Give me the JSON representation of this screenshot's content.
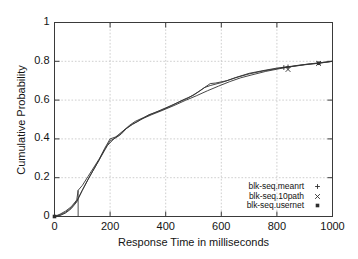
{
  "chart_data": {
    "type": "line",
    "title": "",
    "subtitle": "",
    "xlabel": "Response Time in milliseconds",
    "ylabel": "Cumulative Probability",
    "xlim": [
      0,
      1000
    ],
    "ylim": [
      0,
      1
    ],
    "xticks": [
      "0",
      "200",
      "400",
      "600",
      "800",
      "1000"
    ],
    "xtick_values": [
      0,
      200,
      400,
      600,
      800,
      1000
    ],
    "yticks": [
      "0",
      "0.2",
      "0.4",
      "0.6",
      "0.8",
      "1"
    ],
    "ytick_values": [
      0,
      0.2,
      0.4,
      0.6,
      0.8,
      1
    ],
    "grid": true,
    "legend_position": "bottom-right-inside",
    "annotations": [
      {
        "name": "vertical-drop-line",
        "x": 85,
        "y_from": 0,
        "y_to": 0.135
      }
    ],
    "series": [
      {
        "name": "blk-seq.meanrt",
        "marker": "plus",
        "x": [
          0,
          20,
          40,
          60,
          80,
          85,
          100,
          120,
          140,
          160,
          180,
          200,
          220,
          240,
          260,
          280,
          300,
          340,
          380,
          420,
          460,
          500,
          540,
          560,
          600,
          650,
          700,
          750,
          800,
          825,
          850,
          900,
          950,
          1000
        ],
        "y": [
          0.0,
          0.012,
          0.028,
          0.05,
          0.085,
          0.135,
          0.16,
          0.205,
          0.25,
          0.295,
          0.345,
          0.39,
          0.405,
          0.425,
          0.455,
          0.475,
          0.49,
          0.525,
          0.545,
          0.57,
          0.6,
          0.625,
          0.665,
          0.675,
          0.69,
          0.715,
          0.735,
          0.75,
          0.762,
          0.768,
          0.772,
          0.782,
          0.79,
          0.8
        ],
        "marker_points": [
          {
            "x": 825,
            "y": 0.768
          },
          {
            "x": 840,
            "y": 0.771
          }
        ]
      },
      {
        "name": "blk-seq.10path",
        "marker": "cross",
        "x": [
          0,
          20,
          40,
          60,
          80,
          100,
          120,
          140,
          160,
          180,
          200,
          210,
          230,
          250,
          270,
          290,
          320,
          360,
          400,
          440,
          480,
          520,
          560,
          580,
          620,
          660,
          700,
          750,
          800,
          840,
          880,
          920,
          950,
          1000
        ],
        "y": [
          0.0,
          0.005,
          0.018,
          0.04,
          0.075,
          0.135,
          0.19,
          0.24,
          0.29,
          0.35,
          0.4,
          0.405,
          0.415,
          0.445,
          0.47,
          0.49,
          0.51,
          0.535,
          0.56,
          0.585,
          0.61,
          0.645,
          0.685,
          0.688,
          0.7,
          0.72,
          0.738,
          0.752,
          0.765,
          0.772,
          0.78,
          0.787,
          0.792,
          0.8
        ],
        "marker_points": [
          {
            "x": 840,
            "y": 0.758
          },
          {
            "x": 950,
            "y": 0.789
          }
        ]
      },
      {
        "name": "blk-seq.usernet",
        "marker": "star",
        "x": [
          0,
          20,
          40,
          60,
          80,
          100,
          130,
          160,
          190,
          220,
          250,
          280,
          310,
          350,
          390,
          430,
          470,
          510,
          550,
          590,
          630,
          670,
          710,
          760,
          810,
          860,
          910,
          950,
          1000
        ],
        "y": [
          0.0,
          0.008,
          0.022,
          0.045,
          0.08,
          0.135,
          0.215,
          0.29,
          0.365,
          0.41,
          0.445,
          0.475,
          0.5,
          0.525,
          0.548,
          0.572,
          0.598,
          0.622,
          0.648,
          0.672,
          0.695,
          0.715,
          0.73,
          0.748,
          0.762,
          0.775,
          0.785,
          0.79,
          0.8
        ],
        "marker_points": [
          {
            "x": 0,
            "y": 0.0
          },
          {
            "x": 950,
            "y": 0.79
          }
        ]
      }
    ],
    "legend": [
      {
        "label": "blk-seq.meanrt",
        "marker": "plus"
      },
      {
        "label": "blk-seq.10path",
        "marker": "cross"
      },
      {
        "label": "blk-seq.usernet",
        "marker": "star"
      }
    ],
    "colors": {
      "axis": "#3a3a3a",
      "grid": "#b9b9b9",
      "series": "#333333",
      "background": "#ffffff",
      "text": "#141414"
    }
  }
}
